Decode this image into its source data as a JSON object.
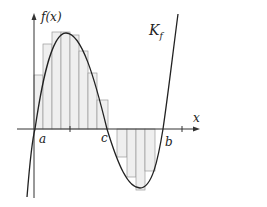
{
  "figure": {
    "y_axis_label": "f(x)",
    "x_axis_label": "x",
    "curve_label": "K",
    "curve_label_sub": "f",
    "point_labels": {
      "a": "a",
      "c": "c",
      "b": "b"
    }
  },
  "geometry": {
    "x_axis_y": 129,
    "y_axis_x": 34,
    "roots_px": {
      "a": 35,
      "c": 107,
      "b": 163
    },
    "peak_px": [
      66,
      33
    ],
    "trough_px": [
      140,
      188
    ],
    "upper_rects": [
      {
        "x0": 34,
        "x1": 43,
        "top": 75
      },
      {
        "x0": 43,
        "x1": 52,
        "top": 44
      },
      {
        "x0": 52,
        "x1": 61,
        "top": 32
      },
      {
        "x0": 61,
        "x1": 70,
        "top": 32
      },
      {
        "x0": 70,
        "x1": 79,
        "top": 35
      },
      {
        "x0": 79,
        "x1": 88,
        "top": 51
      },
      {
        "x0": 88,
        "x1": 97,
        "top": 73
      },
      {
        "x0": 97,
        "x1": 108,
        "top": 100
      }
    ],
    "lower_rects": [
      {
        "x0": 117,
        "x1": 127,
        "bottom": 157
      },
      {
        "x0": 127,
        "x1": 136,
        "bottom": 177
      },
      {
        "x0": 136,
        "x1": 145,
        "bottom": 190
      },
      {
        "x0": 145,
        "x1": 155,
        "bottom": 171
      }
    ]
  },
  "colors": {
    "rect_fill": "#efefef",
    "rect_stroke": "#9a9a9a",
    "curve": "#222222",
    "axis": "#333333"
  }
}
